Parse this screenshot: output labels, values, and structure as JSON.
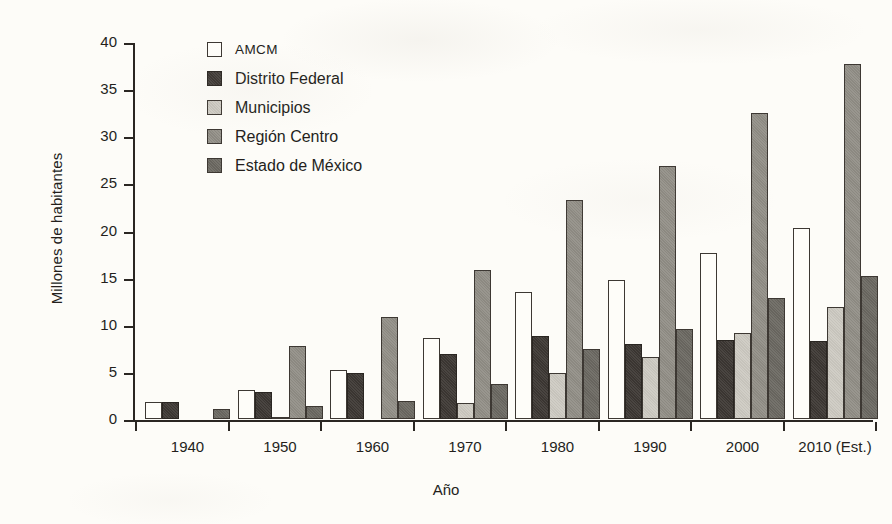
{
  "chart_data": {
    "type": "bar",
    "title": "",
    "xlabel": "Año",
    "ylabel": "Millones de habitantes",
    "categories": [
      "1940",
      "1950",
      "1960",
      "1970",
      "1980",
      "1990",
      "2000",
      "2010 (Est.)"
    ],
    "ylim": [
      0,
      40
    ],
    "yticks": [
      0,
      5,
      10,
      15,
      20,
      25,
      30,
      35,
      40
    ],
    "ytick_labels": [
      "0",
      "5",
      "10",
      "15",
      "20",
      "25",
      "30",
      "35",
      "40"
    ],
    "grid": false,
    "legend_position": "upper-left-inside",
    "series": [
      {
        "name": "AMCM",
        "color": "#fefdf9",
        "values": [
          1.8,
          3.1,
          5.2,
          8.6,
          13.5,
          14.8,
          17.6,
          20.3
        ]
      },
      {
        "name": "Distrito Federal",
        "color": "#3c3733",
        "values": [
          1.8,
          2.9,
          4.9,
          6.9,
          8.8,
          8.0,
          8.4,
          8.3
        ]
      },
      {
        "name": "Municipios",
        "color": "#cdcac2",
        "values": [
          0.0,
          0.1,
          0.0,
          1.7,
          4.9,
          6.6,
          9.1,
          11.9
        ]
      },
      {
        "name": "Región Centro",
        "color": "#918e86",
        "values": [
          0.0,
          7.8,
          10.8,
          15.8,
          23.2,
          26.8,
          32.5,
          37.7
        ]
      },
      {
        "name": "Estado de México",
        "color": "#6b6861",
        "values": [
          1.1,
          1.4,
          1.9,
          3.7,
          7.4,
          9.5,
          12.8,
          15.2
        ]
      }
    ]
  },
  "axes": {
    "y_title": "Millones de habitantes",
    "x_title": "Año"
  },
  "legend": {
    "items": [
      {
        "label": "AMCM",
        "swatch": "legend-swatch-amcm"
      },
      {
        "label": "Distrito Federal",
        "swatch": "legend-swatch-distrito-federal"
      },
      {
        "label": "Municipios",
        "swatch": "legend-swatch-municipios"
      },
      {
        "label": "Región Centro",
        "swatch": "legend-swatch-region-centro"
      },
      {
        "label": "Estado de México",
        "swatch": "legend-swatch-estado-de-mexico"
      }
    ]
  },
  "colors": {
    "background": "#fdfcf8",
    "ink": "#241f1c",
    "axis": "#2a2622"
  }
}
